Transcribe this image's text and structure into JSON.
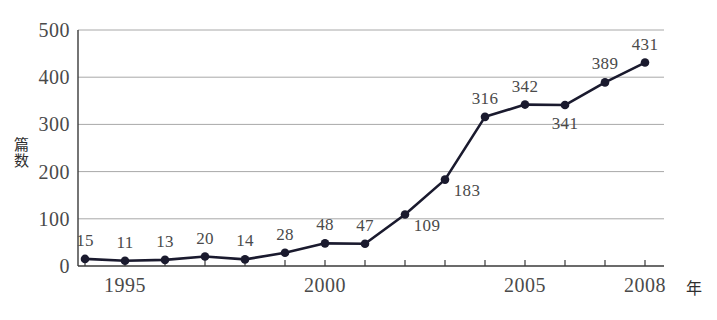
{
  "chart_data": {
    "type": "line",
    "title": "",
    "xlabel": "年",
    "ylabel": "篇数",
    "ylim": [
      0,
      500
    ],
    "xlim": [
      1994,
      2008
    ],
    "grid": true,
    "legend": false,
    "y_ticks": [
      0,
      100,
      200,
      300,
      400,
      500
    ],
    "x_ticks_labeled": [
      1995,
      2000,
      2005,
      2008
    ],
    "x": [
      1994,
      1995,
      1996,
      1997,
      1998,
      1999,
      2000,
      2001,
      2002,
      2003,
      2004,
      2005,
      2006,
      2007,
      2008
    ],
    "values": [
      15,
      11,
      13,
      20,
      14,
      28,
      48,
      47,
      109,
      183,
      316,
      342,
      341,
      389,
      431
    ],
    "point_labels": [
      "15",
      "11",
      "13",
      "20",
      "14",
      "28",
      "48",
      "47",
      "109",
      "183",
      "316",
      "342",
      "341",
      "389",
      "431"
    ],
    "point_label_placement": [
      "above",
      "above",
      "above",
      "above",
      "above",
      "above",
      "above",
      "above",
      "right",
      "right",
      "above",
      "above",
      "below",
      "above",
      "above"
    ],
    "series_color": "#1a1a2e",
    "grid_color": "#a8a8a8",
    "axis_color": "#3a3a3a",
    "marker": "filled-circle"
  },
  "axis": {
    "y_title_chars": [
      "篇",
      "数"
    ],
    "x_title": "年",
    "y_tick_labels": [
      "0",
      "100",
      "200",
      "300",
      "400",
      "500"
    ],
    "x_tick_labels": [
      "1995",
      "2000",
      "2005",
      "2008"
    ]
  }
}
